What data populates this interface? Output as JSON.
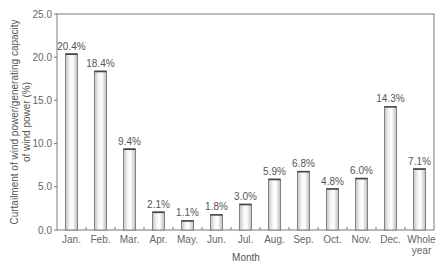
{
  "chart_data": {
    "type": "bar",
    "title": "",
    "xlabel": "Month",
    "ylabel_lines": [
      "Curtailment of wind power/generating capacity",
      "of wind power (%)"
    ],
    "ylabel": "Curtailment of wind power/generating capacity of wind power (%)",
    "ylim": [
      0,
      25
    ],
    "yticks": [
      "0.0",
      "5.0",
      "10.0",
      "15.0",
      "20.0",
      "25.0"
    ],
    "grid": false,
    "legend": null,
    "categories": [
      "Jan.",
      "Feb.",
      "Mar.",
      "Apr.",
      "May.",
      "Jun.",
      "Jul.",
      "Aug.",
      "Sep.",
      "Oct.",
      "Nov.",
      "Dec.",
      "Whole year"
    ],
    "category_lines": [
      [
        "Jan."
      ],
      [
        "Feb."
      ],
      [
        "Mar."
      ],
      [
        "Apr."
      ],
      [
        "May."
      ],
      [
        "Jun."
      ],
      [
        "Jul."
      ],
      [
        "Aug."
      ],
      [
        "Sep."
      ],
      [
        "Oct."
      ],
      [
        "Nov."
      ],
      [
        "Dec."
      ],
      [
        "Whole",
        "year"
      ]
    ],
    "values": [
      20.4,
      18.4,
      9.4,
      2.1,
      1.1,
      1.8,
      3.0,
      5.9,
      6.8,
      4.8,
      6.0,
      14.3,
      7.1
    ],
    "value_labels": [
      "20.4%",
      "18.4%",
      "9.4%",
      "2.1%",
      "1.1%",
      "1.8%",
      "3.0%",
      "5.9%",
      "6.8%",
      "4.8%",
      "6.0%",
      "14.3%",
      "7.1%"
    ],
    "colors": {
      "bar_fill_light": "#f4f4f4",
      "bar_fill_dark": "#bdbdbd",
      "bar_stroke": "#6a6a6a",
      "axis": "#777777"
    }
  }
}
